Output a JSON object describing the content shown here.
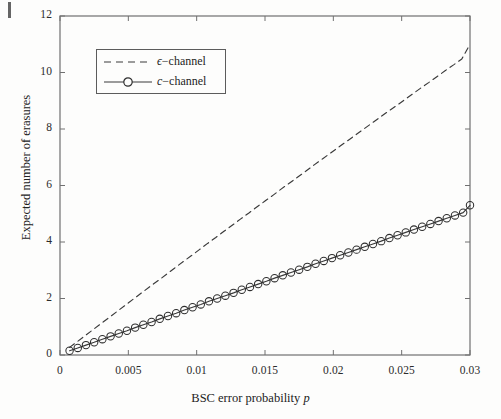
{
  "chart_data": {
    "type": "line",
    "title": "",
    "xlabel": "BSC error probability p",
    "xlabel_plain": "BSC error probability",
    "xlabel_italic_symbol": "p",
    "ylabel": "Expected number of erasures",
    "xlim": [
      0,
      0.03
    ],
    "ylim": [
      0,
      12
    ],
    "xticks": [
      0,
      0.005,
      0.01,
      0.015,
      0.02,
      0.025,
      0.03
    ],
    "xtick_labels": [
      "0",
      "0.005",
      "0.01",
      "0.015",
      "0.02",
      "0.025",
      "0.03"
    ],
    "yticks": [
      0,
      2,
      4,
      6,
      8,
      10,
      12
    ],
    "ytick_labels": [
      "0",
      "2",
      "4",
      "6",
      "8",
      "10",
      "12"
    ],
    "grid": false,
    "legend_position": "upper left",
    "series": [
      {
        "name": "ϵ−channel",
        "name_symbol": "ϵ",
        "name_suffix": "−channel",
        "style": "dashed",
        "marker": "none",
        "color": "#3a3a3a",
        "x": [
          0.0007,
          0.0012,
          0.0018,
          0.0024,
          0.003,
          0.0036,
          0.0042,
          0.0048,
          0.0054,
          0.006,
          0.0066,
          0.0072,
          0.0078,
          0.0084,
          0.009,
          0.0096,
          0.0102,
          0.0108,
          0.0114,
          0.012,
          0.0126,
          0.0132,
          0.0138,
          0.0144,
          0.015,
          0.0156,
          0.0162,
          0.0168,
          0.0174,
          0.018,
          0.0186,
          0.0192,
          0.0198,
          0.0204,
          0.021,
          0.0216,
          0.0222,
          0.0228,
          0.0234,
          0.024,
          0.0246,
          0.0252,
          0.0258,
          0.0264,
          0.027,
          0.0276,
          0.0282,
          0.0288,
          0.0294,
          0.03
        ],
        "y": [
          0.27,
          0.45,
          0.67,
          0.89,
          1.11,
          1.33,
          1.55,
          1.77,
          1.99,
          2.21,
          2.43,
          2.64,
          2.86,
          3.08,
          3.3,
          3.51,
          3.73,
          3.95,
          4.16,
          4.38,
          4.59,
          4.81,
          5.02,
          5.24,
          5.45,
          5.66,
          5.88,
          6.09,
          6.3,
          6.51,
          6.73,
          6.94,
          7.15,
          7.36,
          7.57,
          7.78,
          7.99,
          8.2,
          8.41,
          8.62,
          8.82,
          9.03,
          9.24,
          9.45,
          9.65,
          9.86,
          10.07,
          10.27,
          10.48,
          11.0
        ]
      },
      {
        "name": "c−channel",
        "name_symbol": "c",
        "name_suffix": "−channel",
        "style": "solid",
        "marker": "circle",
        "color": "#3a3a3a",
        "x": [
          0.0007,
          0.0013,
          0.0019,
          0.0025,
          0.0031,
          0.0037,
          0.0043,
          0.0049,
          0.0055,
          0.0061,
          0.0067,
          0.0073,
          0.0079,
          0.0085,
          0.0091,
          0.0097,
          0.0103,
          0.0109,
          0.0115,
          0.0121,
          0.0127,
          0.0133,
          0.0139,
          0.0145,
          0.0151,
          0.0157,
          0.0163,
          0.0169,
          0.0175,
          0.0181,
          0.0187,
          0.0193,
          0.0199,
          0.0205,
          0.0211,
          0.0217,
          0.0223,
          0.0229,
          0.0235,
          0.0241,
          0.0247,
          0.0253,
          0.0259,
          0.0265,
          0.0271,
          0.0277,
          0.0283,
          0.0289,
          0.0295,
          0.03
        ],
        "y": [
          0.15,
          0.25,
          0.35,
          0.45,
          0.56,
          0.66,
          0.76,
          0.86,
          0.97,
          1.07,
          1.17,
          1.28,
          1.38,
          1.48,
          1.59,
          1.69,
          1.79,
          1.9,
          2.0,
          2.1,
          2.2,
          2.31,
          2.41,
          2.51,
          2.61,
          2.72,
          2.82,
          2.92,
          3.02,
          3.12,
          3.23,
          3.33,
          3.43,
          3.53,
          3.63,
          3.73,
          3.83,
          3.93,
          4.03,
          4.14,
          4.24,
          4.34,
          4.44,
          4.54,
          4.64,
          4.74,
          4.84,
          4.94,
          5.04,
          5.3
        ]
      }
    ]
  }
}
